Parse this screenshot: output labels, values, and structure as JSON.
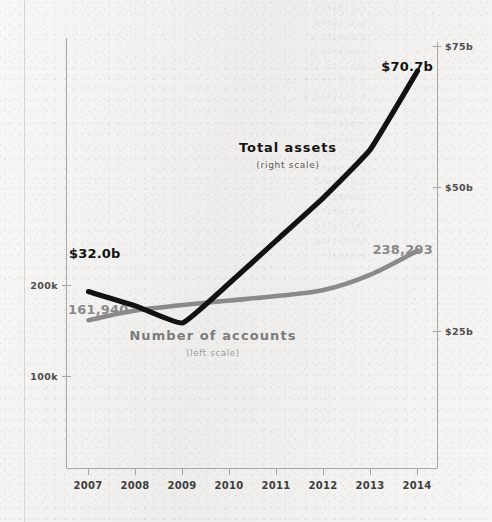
{
  "chart_data": {
    "type": "line",
    "title": "",
    "xlabel": "",
    "grid": false,
    "legend_position": "inline-annotations",
    "x": [
      2007,
      2008,
      2009,
      2010,
      2011,
      2012,
      2013,
      2014
    ],
    "x_tick_labels": [
      "2007",
      "2008",
      "2009",
      "2010",
      "2011",
      "2012",
      "2013",
      "2014"
    ],
    "left_axis": {
      "label": "Number of accounts",
      "sub_label": "(left scale)",
      "tick_labels": [
        "200k",
        "100k"
      ],
      "tick_values": [
        200000,
        100000
      ],
      "ylim": [
        0,
        300000
      ],
      "color": "#8a8a8a"
    },
    "right_axis": {
      "label": "Total assets",
      "sub_label": "(right scale)",
      "tick_labels": [
        "$75b",
        "$50b",
        "$25b"
      ],
      "tick_values": [
        75,
        50,
        25
      ],
      "ylim": [
        0,
        87.5
      ],
      "color": "#121212"
    },
    "series": [
      {
        "name": "Total assets",
        "sub_label": "(right scale)",
        "axis": "right",
        "unit": "$b",
        "color": "#121212",
        "values": [
          32.0,
          29.5,
          26.5,
          33.5,
          41.0,
          48.5,
          57.0,
          70.7
        ],
        "start_label": "$32.0b",
        "end_label": "$70.7b"
      },
      {
        "name": "Number of accounts",
        "sub_label": "(left scale)",
        "axis": "left",
        "unit": "accounts",
        "color": "#8a8a8a",
        "values": [
          161940,
          172500,
          178500,
          183500,
          188500,
          195000,
          212000,
          238293
        ],
        "start_label": "161,940",
        "end_label": "238,293"
      }
    ],
    "annotations": [
      {
        "text": "$32.0b",
        "kind": "value-label",
        "series": "Total assets",
        "at_x": 2007
      },
      {
        "text": "$70.7b",
        "kind": "value-label",
        "series": "Total assets",
        "at_x": 2014
      },
      {
        "text": "161,940",
        "kind": "value-label",
        "series": "Number of accounts",
        "at_x": 2007
      },
      {
        "text": "238,293",
        "kind": "value-label",
        "series": "Number of accounts",
        "at_x": 2014
      },
      {
        "text": "Total assets",
        "kind": "series-label",
        "series": "Total assets"
      },
      {
        "text": "(right scale)",
        "kind": "series-sublabel",
        "series": "Total assets"
      },
      {
        "text": "Number of accounts",
        "kind": "series-label",
        "series": "Number of accounts"
      },
      {
        "text": "(left scale)",
        "kind": "series-sublabel",
        "series": "Number of accounts"
      }
    ]
  },
  "colors": {
    "background": "#f1f0ee",
    "total_assets_line": "#121212",
    "accounts_line": "#8a8a8a",
    "axis": "#a9a7a4",
    "axis_text": "#4d4d4d",
    "page_rule": "#d8d6d3"
  },
  "showthrough_text": "  cvjitaeli\n  ajtrtbrfe\n  ilbnnpti c\n  ctnerhlp i\n  ebnl co sf\n  nrEjD ht rt an\n  erlltbnlr g\n  cjtiaeiocn\n  ntbeilaeu\n  ilnteacpr\n  cntbrlotrc\n  etilnbaoa\n  lcjtebnrl\n  tienbpalr\n  nctiebtri\n  eblnraltc\n  tcnbielap\n  bcntealr"
}
